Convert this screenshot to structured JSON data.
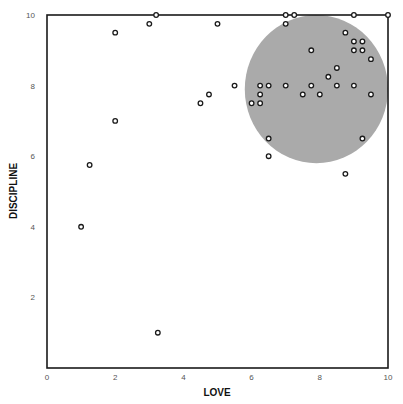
{
  "chart_data": {
    "type": "scatter",
    "title": "",
    "xlabel": "LOVE",
    "ylabel": "DISCIPLINE",
    "xlim": [
      0,
      10
    ],
    "ylim": [
      0,
      10
    ],
    "xticks": [
      0,
      2,
      4,
      6,
      8,
      10
    ],
    "yticks": [
      2,
      4,
      6,
      8,
      10
    ],
    "grid": false,
    "legend": null,
    "marker": "hollow-circle",
    "highlight_region": {
      "shape": "circle",
      "center": [
        7.9,
        7.9
      ],
      "radius_x": 2.1,
      "radius_y": 2.1,
      "color": "#aaaaaa"
    },
    "points": [
      {
        "x": 1.0,
        "y": 4.0
      },
      {
        "x": 1.25,
        "y": 5.75
      },
      {
        "x": 2.0,
        "y": 9.5
      },
      {
        "x": 2.0,
        "y": 7.0
      },
      {
        "x": 3.0,
        "y": 9.75
      },
      {
        "x": 3.2,
        "y": 10.0
      },
      {
        "x": 3.25,
        "y": 1.0
      },
      {
        "x": 4.5,
        "y": 7.5
      },
      {
        "x": 4.75,
        "y": 7.75
      },
      {
        "x": 5.0,
        "y": 9.75
      },
      {
        "x": 5.5,
        "y": 8.0
      },
      {
        "x": 6.0,
        "y": 7.5
      },
      {
        "x": 6.25,
        "y": 7.5
      },
      {
        "x": 6.25,
        "y": 7.75
      },
      {
        "x": 6.25,
        "y": 8.0
      },
      {
        "x": 6.5,
        "y": 8.0
      },
      {
        "x": 6.5,
        "y": 6.5
      },
      {
        "x": 6.5,
        "y": 6.0
      },
      {
        "x": 7.0,
        "y": 10.0
      },
      {
        "x": 7.25,
        "y": 10.0
      },
      {
        "x": 7.0,
        "y": 9.75
      },
      {
        "x": 7.0,
        "y": 8.0
      },
      {
        "x": 7.5,
        "y": 7.75
      },
      {
        "x": 7.75,
        "y": 9.0
      },
      {
        "x": 7.75,
        "y": 8.0
      },
      {
        "x": 8.0,
        "y": 7.75
      },
      {
        "x": 8.25,
        "y": 8.25
      },
      {
        "x": 8.5,
        "y": 8.5
      },
      {
        "x": 8.5,
        "y": 8.0
      },
      {
        "x": 8.75,
        "y": 9.5
      },
      {
        "x": 9.0,
        "y": 9.25
      },
      {
        "x": 9.25,
        "y": 9.25
      },
      {
        "x": 9.0,
        "y": 9.0
      },
      {
        "x": 9.25,
        "y": 9.0
      },
      {
        "x": 9.5,
        "y": 8.75
      },
      {
        "x": 9.0,
        "y": 8.0
      },
      {
        "x": 9.5,
        "y": 7.75
      },
      {
        "x": 9.0,
        "y": 10.0
      },
      {
        "x": 10.0,
        "y": 10.0
      },
      {
        "x": 9.25,
        "y": 6.5
      },
      {
        "x": 8.75,
        "y": 5.5
      }
    ]
  },
  "colors": {
    "axis": "#1a1a1a",
    "marker_stroke": "#1a1a1a",
    "marker_fill": "#ffffff",
    "highlight": "#aaaaaa",
    "tick_text": "#555555"
  }
}
